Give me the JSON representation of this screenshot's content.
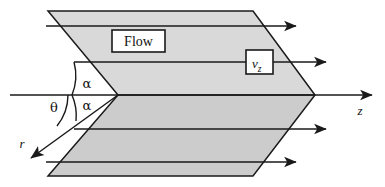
{
  "diagram": {
    "type": "technical-schematic",
    "background_color": "#ffffff",
    "stroke_color": "#1a1a1a",
    "fill_upper_color": "#d9d9d9",
    "fill_lower_color": "#cccccc",
    "labels": {
      "flow": "Flow",
      "velocity": "v",
      "velocity_subscript": "z",
      "axis_z": "z",
      "axis_r": "r",
      "angle_alpha_upper": "α",
      "angle_alpha_lower": "α",
      "angle_theta": "θ"
    },
    "geometry": {
      "apex_left": [
        118,
        95
      ],
      "apex_right": [
        315,
        95
      ],
      "top_left": [
        48,
        11
      ],
      "top_right": [
        253,
        11
      ],
      "bottom_left": [
        48,
        176
      ],
      "bottom_right": [
        253,
        176
      ],
      "axis_start_x": 10,
      "axis_end_x": 372,
      "axis_y": 95,
      "r_arrow_start": [
        118,
        95
      ],
      "r_arrow_end": [
        31,
        158
      ]
    },
    "flow_lines": [
      {
        "name": "flow-line-1",
        "y": 26,
        "x_start": 46,
        "x_end": 296
      },
      {
        "name": "flow-line-2",
        "y": 62,
        "x_start": 74,
        "x_end": 326
      },
      {
        "name": "flow-line-3",
        "y": 129,
        "x_start": 74,
        "x_end": 326
      },
      {
        "name": "flow-line-4",
        "y": 162,
        "x_start": 46,
        "x_end": 296
      }
    ],
    "callout_boxes": [
      {
        "name": "flow-label-box",
        "x": 112,
        "y": 30,
        "width": 53,
        "height": 22
      },
      {
        "name": "velocity-label-box",
        "x": 246,
        "y": 50,
        "width": 27,
        "height": 24
      }
    ]
  }
}
